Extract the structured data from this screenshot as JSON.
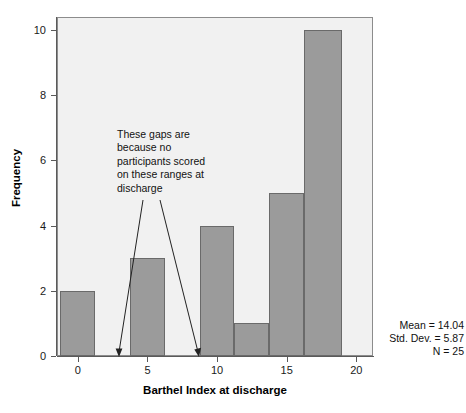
{
  "chart_data": {
    "type": "bar",
    "title": "",
    "xlabel": "Barthel Index at discharge",
    "ylabel": "Frequency",
    "xlim": [
      -1.5,
      21.2
    ],
    "ylim": [
      0,
      10.4
    ],
    "xticks": [
      0,
      5,
      10,
      15,
      20
    ],
    "yticks": [
      0,
      2,
      4,
      6,
      8,
      10
    ],
    "grid": false,
    "legend": null,
    "bin_width": 2.5,
    "bars": [
      {
        "label": "0",
        "x_left": -1.25,
        "x_right": 1.25,
        "x_center": 0.0,
        "value": 2
      },
      {
        "label": "5",
        "x_left": 3.75,
        "x_right": 6.25,
        "x_center": 5.0,
        "value": 3
      },
      {
        "label": "10",
        "x_left": 8.75,
        "x_right": 11.25,
        "x_center": 10.0,
        "value": 4
      },
      {
        "label": "12.5",
        "x_left": 11.25,
        "x_right": 13.75,
        "x_center": 12.5,
        "value": 1
      },
      {
        "label": "15",
        "x_left": 13.75,
        "x_right": 16.25,
        "x_center": 15.0,
        "value": 5
      },
      {
        "label": "18.75",
        "x_left": 16.25,
        "x_right": 19.0,
        "x_center": 17.6,
        "value": 10
      }
    ],
    "categories": [
      "0",
      "5",
      "10",
      "12.5",
      "15",
      "18.75"
    ],
    "values": [
      2,
      3,
      4,
      1,
      5,
      10
    ],
    "bar_fill_color": "#9b9b9b",
    "bar_border_color": "#6a6a6a",
    "panel_background": "#f1f1f1",
    "annotations": [
      {
        "text": "These gaps are because no participants scored on these ranges at discharge",
        "lines": [
          "These gaps are",
          "because no",
          "participants scored",
          "on these ranges at",
          "discharge"
        ],
        "arrow_targets": [
          3.5,
          9.0
        ]
      }
    ],
    "statistics": {
      "mean_label": "Mean = 14.04",
      "std_dev_label": "Std. Dev. = 5.87",
      "n_label": "N = 25",
      "mean": 14.04,
      "std_dev": 5.87,
      "n": 25
    }
  },
  "axis": {
    "x_title": "Barthel Index at discharge",
    "y_title": "Frequency",
    "x_tick_labels": [
      "0",
      "5",
      "10",
      "15",
      "20"
    ],
    "y_tick_labels": [
      "0",
      "2",
      "4",
      "6",
      "8",
      "10"
    ]
  },
  "annotation": {
    "line1": "These gaps are",
    "line2": "because no",
    "line3": "participants scored",
    "line4": "on these ranges at",
    "line5": "discharge"
  },
  "stats": {
    "mean": "Mean = 14.04",
    "std_dev": "Std. Dev. = 5.87",
    "n": "N = 25"
  }
}
